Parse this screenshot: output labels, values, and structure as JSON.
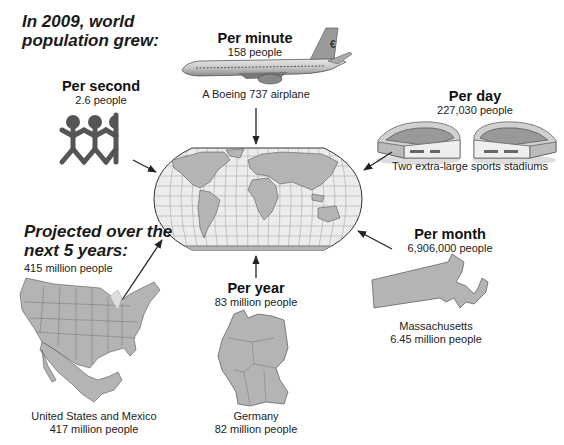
{
  "headline": {
    "line1": "In 2009, world",
    "line2": "population grew:"
  },
  "rates": {
    "per_second": {
      "label": "Per second",
      "value": "2.6 people",
      "icon": "people-chain-icon"
    },
    "per_minute": {
      "label": "Per minute",
      "value": "158 people",
      "caption": "A Boeing 737 airplane",
      "icon": "airplane-icon"
    },
    "per_day": {
      "label": "Per day",
      "value": "227,030 people",
      "caption": "Two extra-large sports stadiums",
      "icon": "stadium-icon"
    },
    "per_month": {
      "label": "Per month",
      "value": "6,906,000 people",
      "caption_line1": "Massachusetts",
      "caption_line2": "6.45 million people",
      "icon": "massachusetts-map-icon"
    },
    "per_year": {
      "label": "Per year",
      "value": "83 million people",
      "caption_line1": "Germany",
      "caption_line2": "82 million people",
      "icon": "germany-map-icon"
    }
  },
  "projection": {
    "line1": "Projected over the",
    "line2": "next 5 years:",
    "value": "415 million people",
    "caption_line1": "United States and Mexico",
    "caption_line2": "417 million people",
    "icon": "us-mexico-map-icon"
  },
  "center": {
    "icon": "world-map-icon"
  },
  "colors": {
    "map_fill": "#b4b4b4",
    "map_stroke": "#555555",
    "ocean": "#e6e6e6",
    "arrow": "#222222",
    "figure": "#555555"
  }
}
